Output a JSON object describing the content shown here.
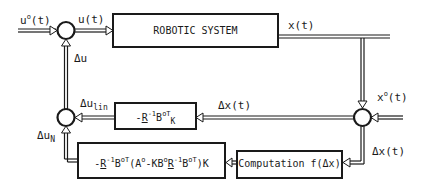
{
  "diagram": {
    "blocks": {
      "robotic_system": "ROBOTIC SYSTEM",
      "linear_gain": {
        "prefix": "-",
        "R": "R",
        "exp1": "-1",
        "B": "B",
        "exp2": "oT",
        "suffix": "K"
      },
      "nonlinear_gain": {
        "text": "-R-1BoT(Ao-KBoR-1BoT)K",
        "part1": "-",
        "R": "R",
        "exp1": "-1",
        "B": "B",
        "exp2": "oT",
        "open": "(",
        "A": "A",
        "exp3": "o",
        "mid": "-KB",
        "exp4": "o",
        "R2": "R",
        "exp5": "-1",
        "B2": "B",
        "exp6": "oT",
        "close": ")K"
      },
      "computation": "Computation f(Δx)"
    },
    "signals": {
      "u0_base": "u",
      "u0_sup": "o",
      "u0_arg": "(t)",
      "u": "u(t)",
      "x": "x(t)",
      "x0_base": "x",
      "x0_sup": "o",
      "x0_arg": "(t)",
      "dx_upper": "Δx(t)",
      "dx_lower": "Δx(t)",
      "du": "Δu",
      "du_lin_base": "Δu",
      "du_lin_sub": "lin",
      "du_n_base": "Δu",
      "du_n_sub": "N"
    },
    "colors": {
      "line": "#1a1a1a",
      "background": "#ffffff"
    }
  }
}
